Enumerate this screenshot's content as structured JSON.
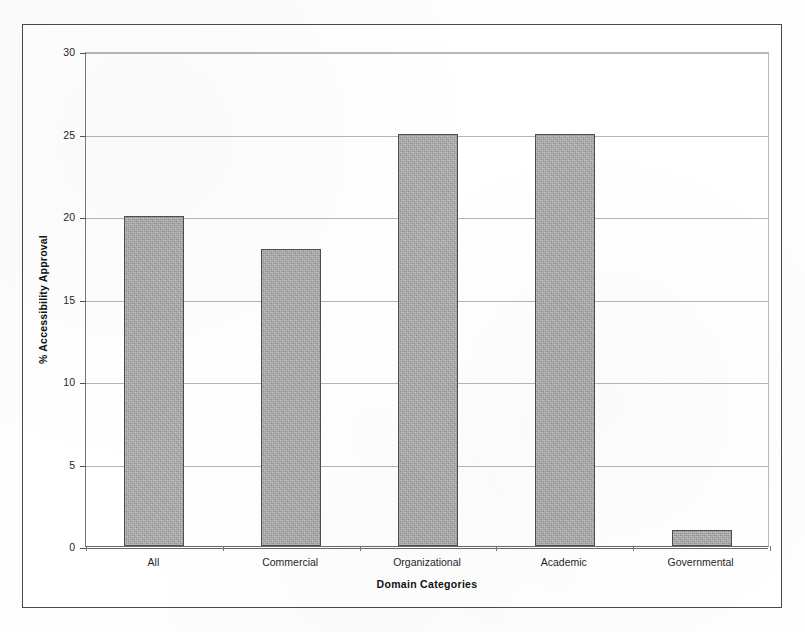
{
  "figure": {
    "background_color": "#ffffff",
    "frame_color": "#4a4a4a",
    "bar_fill_color": "#a9a9a9",
    "bar_border_color": "#4e4e4e",
    "gridline_color": "#b5b5b5",
    "axis_color": "#6a6a6a"
  },
  "chart_data": {
    "type": "bar",
    "title": "",
    "xlabel": "Domain Categories",
    "ylabel": "% Accessibility Approval",
    "categories": [
      "All",
      "Commercial",
      "Organizational",
      "Academic",
      "Governmental"
    ],
    "values": [
      20,
      18,
      25,
      25,
      1
    ],
    "series": [
      {
        "name": "% Accessibility Approval",
        "values": [
          20,
          18,
          25,
          25,
          1
        ]
      }
    ],
    "ylim": [
      0,
      30
    ],
    "ytick_values": [
      0,
      5,
      10,
      15,
      20,
      25,
      30
    ],
    "ytick_labels": [
      "0",
      "5",
      "10",
      "15",
      "20",
      "25",
      "30"
    ],
    "grid": true,
    "grid_axis": "y",
    "legend": false,
    "legend_position": "none",
    "bar_color": "#a9a9a9"
  }
}
